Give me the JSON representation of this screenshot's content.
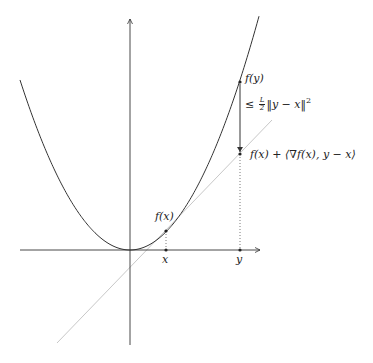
{
  "diagram": {
    "axes": {
      "origin": [
        130,
        250
      ],
      "x_axis": {
        "from": [
          20,
          250
        ],
        "to": [
          260,
          250
        ]
      },
      "y_axis": {
        "from": [
          130,
          345
        ],
        "to": [
          130,
          19
        ]
      }
    },
    "curve": {
      "type": "parabola",
      "vertex": [
        130,
        250
      ],
      "a": 0.01405,
      "x_start": 20,
      "x_end": 259
    },
    "tangent_line": {
      "from": [
        57,
        343
      ],
      "to": [
        272,
        120
      ],
      "color": "#c8c8c8"
    },
    "points": {
      "x": {
        "pos": [
          166,
          250
        ],
        "label": "x"
      },
      "fx": {
        "pos": [
          166,
          231
        ],
        "label": "f(x)"
      },
      "y": {
        "pos": [
          240,
          250
        ],
        "label": "y"
      },
      "fy": {
        "pos": [
          240,
          82
        ],
        "label": "f(y)"
      },
      "lower": {
        "pos": [
          240,
          154
        ],
        "label": "f(x) + ⟨∇f(x), y − x⟩"
      }
    },
    "gap_label": {
      "prefix": "≤",
      "frac_num": "L",
      "frac_den": "2",
      "suffix": "‖y − x‖",
      "power": "2"
    },
    "colors": {
      "curve": "#333333",
      "axis": "#333333",
      "tangent": "#c8c8c8",
      "dotted": "#555555"
    }
  }
}
